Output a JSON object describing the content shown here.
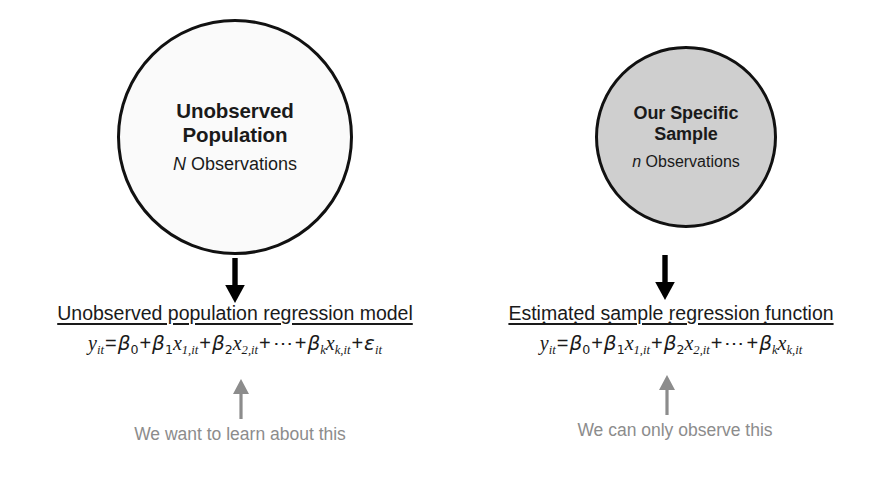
{
  "diagram": {
    "colors": {
      "population_circle_fill": "#fafafa",
      "sample_circle_fill": "#cfcfcf",
      "circle_stroke": "#111111",
      "black_arrow": "#000000",
      "gray_arrow": "#8c8c8c",
      "caption_text": "#8c8c8c"
    },
    "left": {
      "circle": {
        "title_line1": "Unobserved",
        "title_line2": "Population",
        "subtitle_symbol": "N",
        "subtitle_text": "Observations"
      },
      "arrow_icon": "down-arrow-icon",
      "equation": {
        "heading": "Unobserved population regression model",
        "formula_plain": "y_it = β₀ + β₁x₁,it + β₂x₂,it + ⋯ + βₖxₖ,it + ε_it",
        "terms": {
          "lhs": "y",
          "lhs_sub": "it",
          "equals": "=",
          "intercept": "β",
          "intercept_sub": "0",
          "t1_coef": "β",
          "t1_coef_sub": "1",
          "t1_var": "x",
          "t1_var_sub": "1,it",
          "t2_coef": "β",
          "t2_coef_sub": "2",
          "t2_var": "x",
          "t2_var_sub": "2,it",
          "ellipsis": "⋯",
          "tk_coef": "β",
          "tk_coef_sub": "k",
          "tk_var": "x",
          "tk_var_sub": "k,it",
          "error": "ε",
          "error_sub": "it",
          "plus": "+"
        }
      },
      "caption_arrow_icon": "up-arrow-icon",
      "caption": "We want to learn about this"
    },
    "right": {
      "circle": {
        "title_line1": "Our Specific",
        "title_line2": "Sample",
        "subtitle_symbol": "n",
        "subtitle_text": "Observations"
      },
      "arrow_icon": "down-arrow-icon",
      "equation": {
        "heading": "Estimated sample regression function",
        "formula_plain": "ŷ_it = β̂₀ + β̂₁x₁,it + β̂₂x₂,it + ⋯ + β̂ₖxₖ,it",
        "terms": {
          "lhs": "y",
          "lhs_sub": "it",
          "equals": "=",
          "intercept": "β",
          "intercept_sub": "0",
          "t1_coef": "β",
          "t1_coef_sub": "1",
          "t1_var": "x",
          "t1_var_sub": "1,it",
          "t2_coef": "β",
          "t2_coef_sub": "2",
          "t2_var": "x",
          "t2_var_sub": "2,it",
          "ellipsis": "⋯",
          "tk_coef": "β",
          "tk_coef_sub": "k",
          "tk_var": "x",
          "tk_var_sub": "k,it",
          "plus": "+",
          "hat": "ˆ"
        }
      },
      "caption_arrow_icon": "up-arrow-icon",
      "caption": "We can only observe this"
    }
  }
}
